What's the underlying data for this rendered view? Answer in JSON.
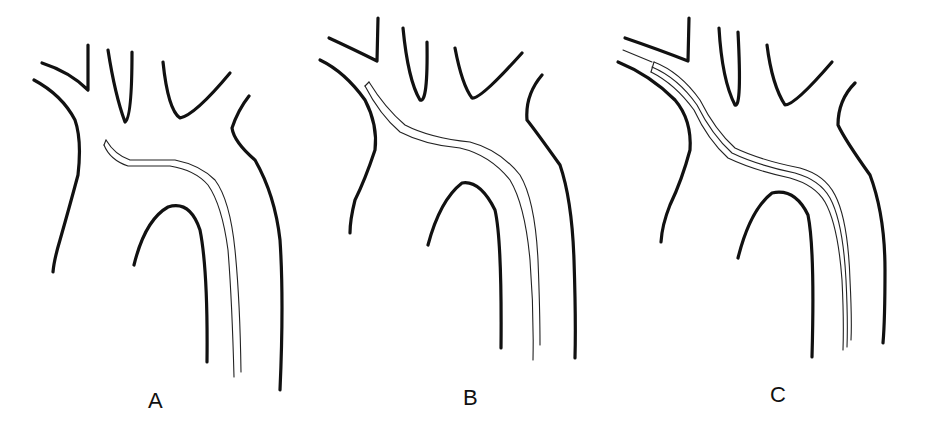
{
  "figure": {
    "panels": [
      {
        "label": "A",
        "catheter_tip": "aortic arch, below brachiocephalic origin"
      },
      {
        "label": "B",
        "catheter_tip": "brachiocephalic/right subclavian origin"
      },
      {
        "label": "C",
        "catheter_tip": "advanced into right subclavian artery over guidewire"
      }
    ],
    "colors": {
      "line": "#111111",
      "background": "#ffffff"
    }
  }
}
